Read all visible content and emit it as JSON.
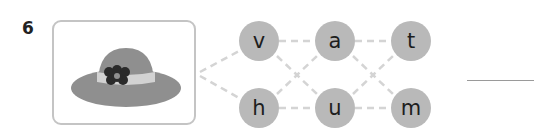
{
  "question": {
    "number": "6",
    "picture": "hat-with-flower",
    "letters": {
      "top": [
        "v",
        "a",
        "t"
      ],
      "bottom": [
        "h",
        "u",
        "m"
      ]
    },
    "answer_value": ""
  },
  "colors": {
    "node_fill": "#b9b9b9",
    "dash_line": "#d4d4d4",
    "hat": "#8f8f8f",
    "hat_band": "#d2d2d2",
    "flower": "#2a2a2a"
  }
}
